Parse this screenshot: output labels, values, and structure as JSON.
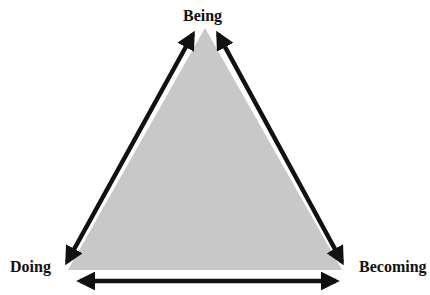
{
  "diagram": {
    "title": "",
    "nodes": {
      "top": "Being",
      "left": "Doing",
      "right": "Becoming"
    },
    "edges": [
      {
        "from": "Being",
        "to": "Doing",
        "type": "double-arrow"
      },
      {
        "from": "Being",
        "to": "Becoming",
        "type": "double-arrow"
      },
      {
        "from": "Doing",
        "to": "Becoming",
        "type": "double-arrow"
      }
    ],
    "colors": {
      "triangle_fill": "#c8c8c8",
      "arrow": "#111111",
      "text": "#111111"
    }
  }
}
